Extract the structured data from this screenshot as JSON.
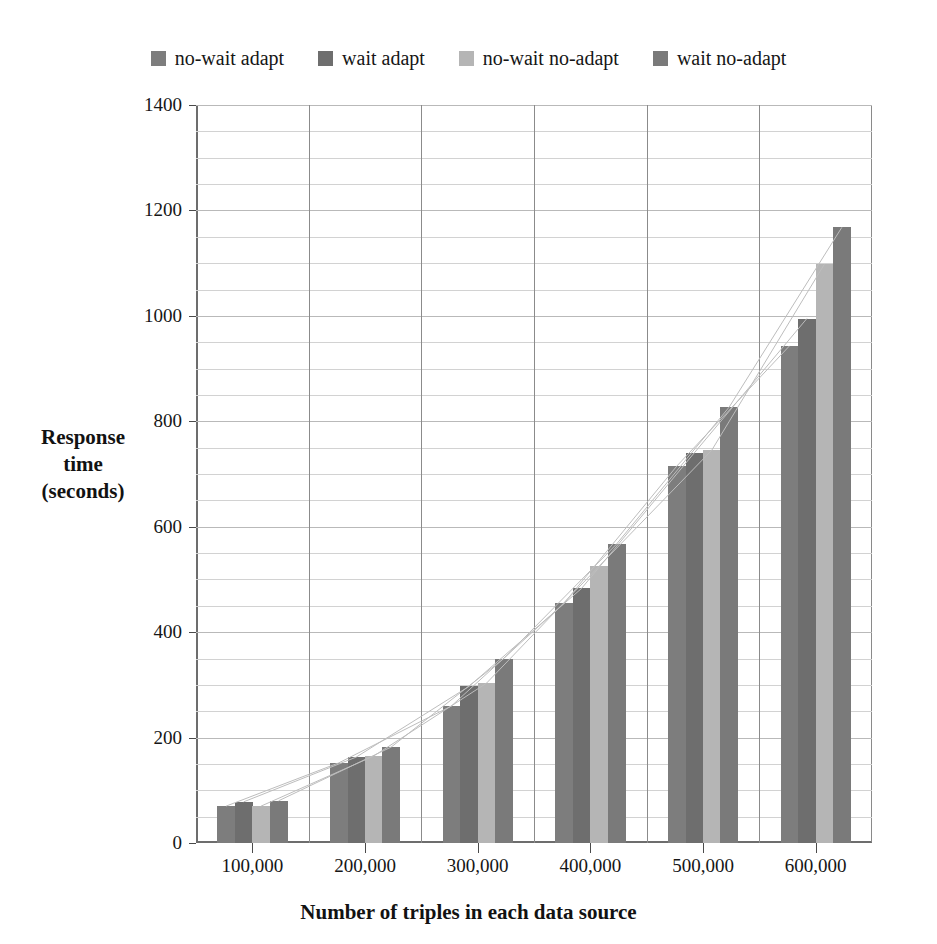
{
  "chart_data": {
    "type": "bar",
    "title": "",
    "subtitle": "",
    "xlabel": "Number of triples in each data source",
    "ylabel": "Response time (seconds)",
    "ylabel_lines": [
      "Response",
      "time",
      "(seconds)"
    ],
    "categories": [
      "100,000",
      "200,000",
      "300,000",
      "400,000",
      "500,000",
      "600,000"
    ],
    "ylim": [
      0,
      1400
    ],
    "yticks": [
      0,
      200,
      400,
      600,
      800,
      1000,
      1200,
      1400
    ],
    "ytick_labels": [
      "0",
      "200",
      "400",
      "600",
      "800",
      "1000",
      "1200",
      "1400"
    ],
    "minor_tick_step": 50,
    "grid": true,
    "grid_vertical": true,
    "legend_position": "top-center",
    "series": [
      {
        "name": "no-wait adapt",
        "color": "#7d7d7d",
        "values": [
          70,
          152,
          260,
          455,
          715,
          943
        ]
      },
      {
        "name": "wait adapt",
        "color": "#6e6e6e",
        "values": [
          78,
          163,
          297,
          483,
          740,
          995
        ]
      },
      {
        "name": "no-wait no-adapt",
        "color": "#b5b5b5",
        "values": [
          70,
          165,
          303,
          525,
          745,
          1098
        ]
      },
      {
        "name": "wait no-adapt",
        "color": "#7a7a7a",
        "values": [
          80,
          182,
          350,
          567,
          827,
          1168
        ]
      }
    ],
    "trend_lines": [
      {
        "name": "trend-no-wait-adapt",
        "color": "#bdbdbd"
      },
      {
        "name": "trend-wait-adapt",
        "color": "#bdbdbd"
      },
      {
        "name": "trend-no-wait-no-adapt",
        "color": "#bdbdbd"
      },
      {
        "name": "trend-wait-no-adapt",
        "color": "#bdbdbd"
      }
    ],
    "annotations": []
  },
  "legend": {
    "entries": [
      {
        "label": "no-wait adapt",
        "color": "#7d7d7d"
      },
      {
        "label": "wait adapt",
        "color": "#6e6e6e"
      },
      {
        "label": "no-wait no-adapt",
        "color": "#b5b5b5"
      },
      {
        "label": "wait no-adapt",
        "color": "#7a7a7a"
      }
    ]
  },
  "axes": {
    "x_title": "Number of triples in each data source",
    "y_title_lines": [
      "Response",
      "time",
      "(seconds)"
    ]
  },
  "colors": {
    "axis": "#4a4a4a",
    "grid_major": "#b9b9b9",
    "grid_minor": "#d2d2d2",
    "grid_vertical": "#8b8b8b",
    "text": "#161616",
    "background": "#ffffff"
  }
}
